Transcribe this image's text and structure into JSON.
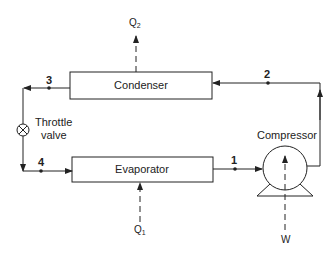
{
  "diagram": {
    "type": "refrigeration-cycle",
    "components": {
      "condenser": "Condenser",
      "evaporator": "Evaporator",
      "compressor": "Compressor",
      "throttle_line1": "Throttle",
      "throttle_line2": "valve"
    },
    "states": {
      "s1": "1",
      "s2": "2",
      "s3": "3",
      "s4": "4"
    },
    "energy": {
      "q_out": "Q",
      "q_out_sub": "2",
      "q_in": "Q",
      "q_in_sub": "1",
      "work": "W"
    },
    "colors": {
      "line": "#222222",
      "background": "#ffffff"
    }
  }
}
